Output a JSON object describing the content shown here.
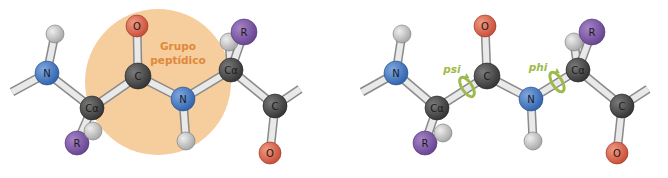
{
  "colors": {
    "nitrogen": "#3f78c8",
    "oxygen": "#d9604a",
    "carbon": "#4a4a4a",
    "hydrogen": "#bdbdbd",
    "r_group": "#7a55a0",
    "peptide_group_fill": "#f6cd9c",
    "peptide_group_text": "#e0893a",
    "rotation_ring": "#9dbb4a"
  },
  "left_panel": {
    "peptide_group_label_line1": "Grupo",
    "peptide_group_label_line2": "peptídico",
    "atoms": {
      "n1": "N",
      "ca1": "Cα",
      "r1": "R",
      "c1": "C",
      "o1": "O",
      "n2": "N",
      "ca2": "Cα",
      "r2": "R",
      "c2": "C",
      "o2": "O"
    }
  },
  "right_panel": {
    "psi_label": "psi",
    "phi_label": "phi",
    "atoms": {
      "n1": "N",
      "ca1": "Cα",
      "r1": "R",
      "c1": "C",
      "o1": "O",
      "n2": "N",
      "ca2": "Cα",
      "r2": "R",
      "c2": "C",
      "o2": "O"
    }
  }
}
